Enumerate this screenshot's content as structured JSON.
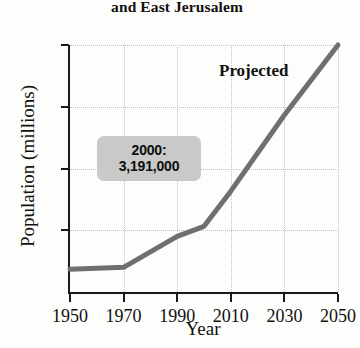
{
  "chart_data": {
    "type": "line",
    "title": "and East Jerusalem",
    "xlabel": "Year",
    "ylabel": "Population (millions)",
    "xlim": [
      1950,
      2050
    ],
    "ylim": [
      0,
      12
    ],
    "grid": true,
    "legend": "none",
    "x_ticks": [
      "1950",
      "1970",
      "1990",
      "2010",
      "2030",
      "2050"
    ],
    "y_ticks": [
      "3",
      "6",
      "9",
      "12"
    ],
    "x": [
      1950,
      1970,
      1990,
      2000,
      2010,
      2030,
      2050
    ],
    "values": [
      1.1,
      1.2,
      2.7,
      3.191,
      4.9,
      8.6,
      12.0
    ],
    "series": [
      {
        "name": "Population",
        "values": [
          1.1,
          1.2,
          2.7,
          3.191,
          4.9,
          8.6,
          12.0
        ]
      }
    ],
    "annotations": [
      {
        "name": "projected-label",
        "text": "Projected",
        "x": 2020,
        "y": 10.4
      },
      {
        "name": "callout-2000",
        "line1": "2000:",
        "line2": "3,191,000",
        "x": 2000,
        "y": 3.191
      }
    ],
    "colors": {
      "line": "#6f6f6f",
      "axis": "#1a1a1a",
      "grid": "#c2c2c2",
      "callout_bg": "#c9c9c9",
      "background": "#fdfdfb",
      "text": "#111111"
    }
  },
  "annotation": {
    "projected": "Projected",
    "callout_year": "2000:",
    "callout_value": "3,191,000"
  }
}
